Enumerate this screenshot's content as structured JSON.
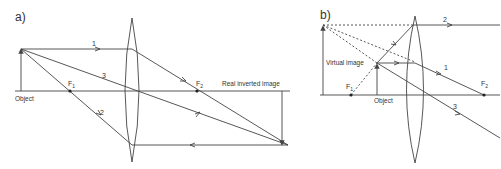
{
  "panels": [
    {
      "id": "a",
      "label": "a)",
      "object_label": "Object",
      "image_label": "Real inverted image",
      "focal_1": "F",
      "focal_1_sub": "1",
      "focal_2": "F",
      "focal_2_sub": "2",
      "ray_labels": [
        "1",
        "2",
        "3"
      ]
    },
    {
      "id": "b",
      "label": "b)",
      "object_label": "Object",
      "image_label": "Virtual image",
      "focal_1": "F",
      "focal_1_sub": "1",
      "focal_2": "F",
      "focal_2_sub": "2",
      "ray_labels": [
        "1",
        "2",
        "3"
      ]
    }
  ],
  "colors": {
    "line": "#444444",
    "text": "#333333"
  }
}
